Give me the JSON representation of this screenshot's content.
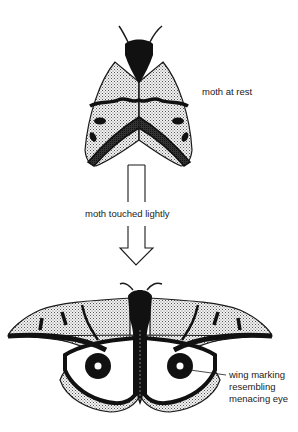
{
  "diagram": {
    "type": "biology-illustration",
    "colors": {
      "outline": "#1a1a1a",
      "wing_stipple": "#cfcfcf",
      "wing_pale": "#ffffff",
      "marking": "#111111",
      "background": "#ffffff"
    },
    "stages": [
      {
        "id": "rest",
        "label": "moth at rest"
      },
      {
        "id": "transition",
        "label": "moth touched lightly"
      },
      {
        "id": "display",
        "label_lines": [
          "wing marking",
          "resembling",
          "menacing eye"
        ]
      }
    ]
  },
  "labels": {
    "rest": "moth at rest",
    "transition": "moth touched lightly",
    "eye_line1": "wing marking",
    "eye_line2": "resembling",
    "eye_line3": "menacing eye"
  }
}
